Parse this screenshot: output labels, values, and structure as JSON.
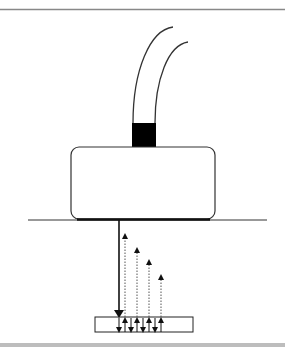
{
  "diagram": {
    "title": "",
    "components": {
      "cables": {
        "count": 2,
        "color": "#333333"
      },
      "connector": {
        "color": "#000000"
      },
      "transducer_body": {
        "stroke": "#333333",
        "fill": "#ffffff"
      },
      "surface_line": {
        "color": "#333333"
      },
      "contact_strip": {
        "color": "#111111"
      },
      "incident_pulse": {
        "style": "solid",
        "color": "#111111"
      },
      "echoes": {
        "count": 4,
        "style": "dotted",
        "color": "#555555"
      },
      "slab": {
        "stroke": "#222222",
        "fill": "#ffffff"
      }
    },
    "frame": {
      "top_rule_color": "#888888",
      "bottom_bar_color": "#bdbdbd"
    }
  }
}
